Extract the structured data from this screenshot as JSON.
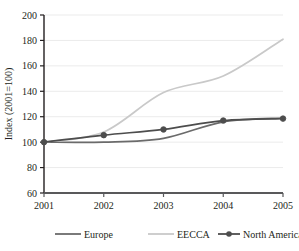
{
  "chart_data": {
    "type": "line",
    "title": "",
    "subtitle": "",
    "xlabel": "",
    "ylabel": "Index (2001=100)",
    "x": [
      2001,
      2002,
      2003,
      2004,
      2005
    ],
    "categories": [
      "2001",
      "2002",
      "2003",
      "2004",
      "2005"
    ],
    "xlim": [
      2001,
      2005
    ],
    "ylim": [
      60,
      200
    ],
    "y_ticks": [
      60,
      80,
      100,
      120,
      140,
      160,
      180,
      200
    ],
    "y_tick_labels": [
      "60",
      "80",
      "100",
      "120",
      "140",
      "160",
      "180",
      "200"
    ],
    "x_ticks": [
      2001,
      2002,
      2003,
      2004,
      2005
    ],
    "x_tick_labels": [
      "2001",
      "2002",
      "2003",
      "2004",
      "2005"
    ],
    "grid": "horizontal",
    "legend_position": "bottom",
    "series": [
      {
        "name": "Europe",
        "color": "#6b6b6b",
        "marker": "none",
        "values": [
          100,
          100,
          103,
          116,
          119
        ]
      },
      {
        "name": "EECCA",
        "color": "#c9c9c9",
        "marker": "none",
        "values": [
          100,
          108,
          139,
          152,
          181
        ]
      },
      {
        "name": "North America",
        "color": "#4d4d4d",
        "marker": "diamond",
        "values": [
          100,
          105.5,
          110,
          117,
          118.5
        ]
      }
    ]
  },
  "legend": {
    "items": [
      {
        "label": "Europe",
        "color": "#6b6b6b",
        "marker": "none"
      },
      {
        "label": "EECCA",
        "color": "#c9c9c9",
        "marker": "none"
      },
      {
        "label": "North America",
        "color": "#4d4d4d",
        "marker": "diamond"
      }
    ]
  },
  "axes": {
    "y_axis_title": "Index (2001=100)"
  },
  "colors": {
    "axis": "#231f20",
    "grid": "#ebebeb",
    "background": "#ffffff",
    "text": "#231f20"
  }
}
